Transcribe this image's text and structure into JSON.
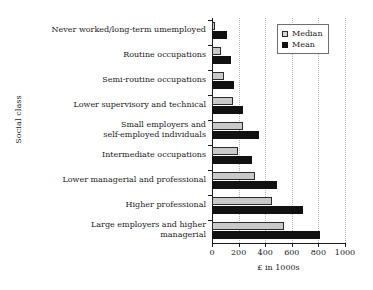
{
  "chart_data": {
    "type": "bar",
    "orientation": "horizontal",
    "title": "",
    "xlabel": "£ in 1000s",
    "ylabel": "Social class",
    "xlim": [
      0,
      1000
    ],
    "xticks": [
      0,
      200,
      400,
      600,
      800,
      1000
    ],
    "xtick_labels": [
      "0",
      "200",
      "400",
      "600",
      "800",
      "1000"
    ],
    "grid": "vertical-dotted",
    "legend_position": "top-right",
    "categories": [
      "Never worked/long-term umemployed",
      "Routine occupations",
      "Semi-routine occupations",
      "Lower supervisory and technical",
      "Small employers and self-employed individuals",
      "Intermediate occupations",
      "Lower managerial and professional",
      "Higher professional",
      "Large employers and higher managerial"
    ],
    "category_lines": [
      [
        "Never worked/long-term umemployed"
      ],
      [
        "Routine occupations"
      ],
      [
        "Semi-routine occupations"
      ],
      [
        "Lower supervisory and technical"
      ],
      [
        "Small employers and",
        "self-employed individuals"
      ],
      [
        "Intermediate occupations"
      ],
      [
        "Lower managerial and professional"
      ],
      [
        "Higher professional"
      ],
      [
        "Large employers and higher",
        "managerial"
      ]
    ],
    "series": [
      {
        "name": "Median",
        "color": "#c9c9c9",
        "values": [
          20,
          70,
          90,
          155,
          230,
          195,
          320,
          450,
          540
        ]
      },
      {
        "name": "Mean",
        "color": "#111111",
        "values": [
          115,
          145,
          165,
          235,
          350,
          300,
          490,
          685,
          815
        ]
      }
    ]
  },
  "legend": {
    "items": [
      {
        "label": "Median",
        "swatch": "median"
      },
      {
        "label": "Mean",
        "swatch": "mean"
      }
    ]
  }
}
